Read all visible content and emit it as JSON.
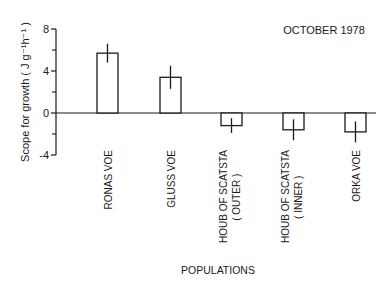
{
  "chart_data": {
    "type": "bar",
    "title": "OCTOBER 1978",
    "xlabel": "POPULATIONS",
    "ylabel": "Scope for growth ( J g⁻¹h⁻¹ )",
    "ylim": [
      -4,
      8
    ],
    "yticks": [
      8,
      4,
      0,
      -4
    ],
    "yminor_ticks": [
      6,
      2,
      -2
    ],
    "grid": false,
    "legend": null,
    "categories": [
      {
        "line1": "RONAS VOE",
        "line2": ""
      },
      {
        "line1": "GLUSS VOE",
        "line2": ""
      },
      {
        "line1": "HOUB OF SCATSTA",
        "line2": "( OUTER )"
      },
      {
        "line1": "HOUB OF SCATSTA",
        "line2": "( INNER )"
      },
      {
        "line1": "ORKA VOE",
        "line2": ""
      }
    ],
    "values": [
      5.7,
      3.4,
      -1.2,
      -1.6,
      -1.8
    ],
    "errors": [
      0.9,
      1.1,
      0.7,
      1.0,
      1.0
    ]
  },
  "colors": {
    "ink": "#1a1a1a",
    "background": "#ffffff",
    "bar_fill": "#ffffff"
  }
}
